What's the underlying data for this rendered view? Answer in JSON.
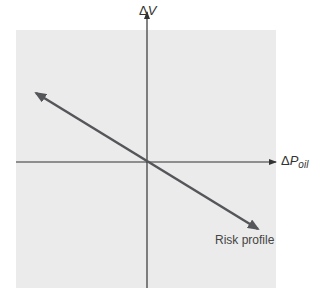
{
  "diagram": {
    "y_axis": {
      "delta": "Δ",
      "var": "V"
    },
    "x_axis": {
      "delta": "Δ",
      "var": "P",
      "sub": "oil"
    },
    "line_label": "Risk profile"
  },
  "colors": {
    "panel": "#ebebeb",
    "axis": "#333333",
    "risk_line": "#55565a",
    "text": "#333333"
  }
}
